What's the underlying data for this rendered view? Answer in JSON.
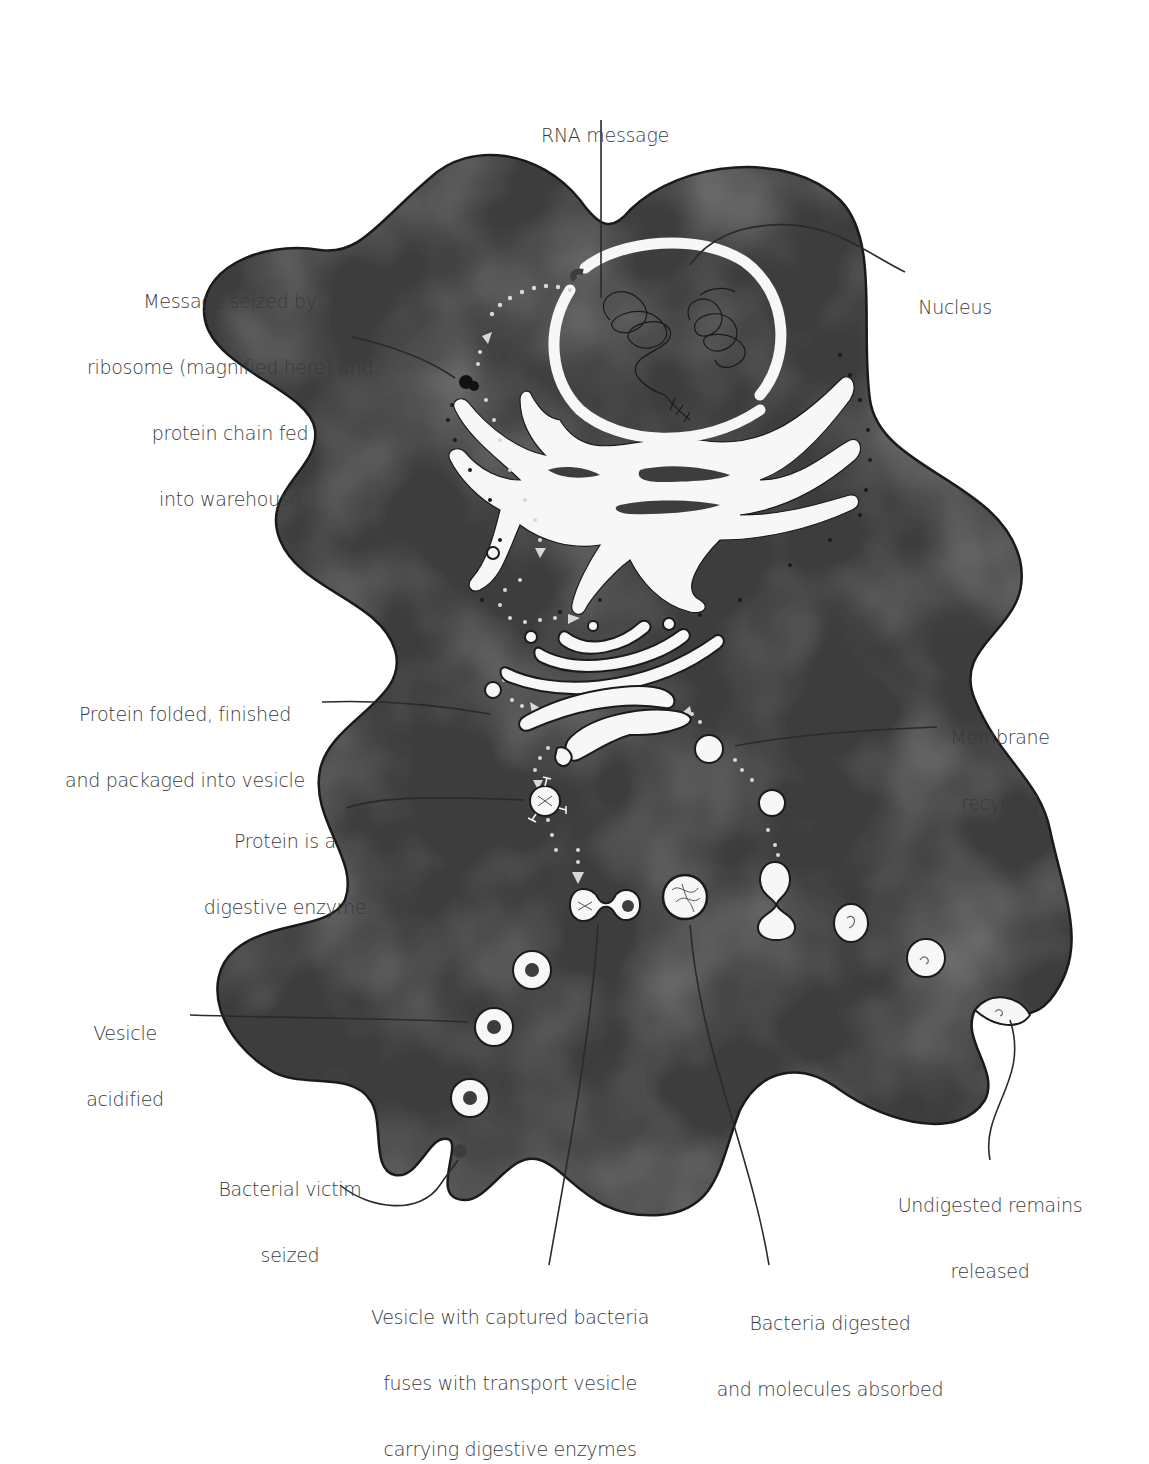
{
  "diagram": {
    "colors": {
      "cytoplasm": "#3d3d3d",
      "cytoplasm_mottle": "#4a4a4a",
      "membrane_outline": "#1a1a1a",
      "organelle_fill": "#f7f7f7",
      "label_text": "#3a3a3a",
      "leader_line": "#2a2a2a",
      "background": "#ffffff"
    },
    "labels": [
      {
        "id": "rna-message",
        "lines": [
          "RNA message"
        ]
      },
      {
        "id": "nucleus",
        "lines": [
          "Nucleus"
        ]
      },
      {
        "id": "ribosome",
        "lines": [
          "Message seized by",
          "ribosome (magnified here) and",
          "protein chain fed",
          "into warehouse"
        ]
      },
      {
        "id": "protein-packaged",
        "lines": [
          "Protein folded, finished",
          "and packaged into vesicle"
        ]
      },
      {
        "id": "membrane-recycled",
        "lines": [
          "Membrane",
          "recycled"
        ]
      },
      {
        "id": "digestive-enzyme",
        "lines": [
          "Protein is a",
          "digestive enzyme"
        ]
      },
      {
        "id": "vesicle-acidified",
        "lines": [
          "Vesicle",
          "acidified"
        ]
      },
      {
        "id": "bacterial-victim",
        "lines": [
          "Bacterial victim",
          "seized"
        ]
      },
      {
        "id": "vesicle-fuses",
        "lines": [
          "Vesicle with captured bacteria",
          "fuses with transport vesicle",
          "carrying digestive enzymes"
        ]
      },
      {
        "id": "bacteria-digested",
        "lines": [
          "Bacteria digested",
          "and molecules absorbed"
        ]
      },
      {
        "id": "undigested-released",
        "lines": [
          "Undigested remains",
          "released"
        ]
      }
    ]
  }
}
